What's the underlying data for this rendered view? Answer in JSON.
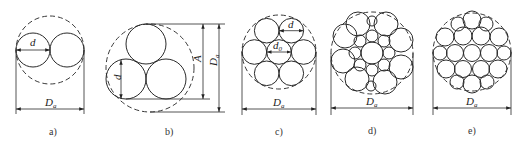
{
  "figure": {
    "panels": [
      {
        "id": "a",
        "caption": "a)",
        "strands": 2,
        "labels": {
          "d": "d",
          "D": "D",
          "D_sub": "a"
        }
      },
      {
        "id": "b",
        "caption": "b)",
        "strands": 3,
        "labels": {
          "d": "d",
          "A": "A",
          "D": "D",
          "D_sub": "a"
        }
      },
      {
        "id": "c",
        "caption": "c)",
        "strands": 7,
        "labels": {
          "d": "d",
          "d0": "d",
          "d0_sub": "0",
          "D": "D",
          "D_sub": "a"
        }
      },
      {
        "id": "d",
        "caption": "d)",
        "strands": 19,
        "labels": {
          "D": "D",
          "D_sub": "a"
        }
      },
      {
        "id": "e",
        "caption": "e)",
        "strands": 19,
        "labels": {
          "D": "D",
          "D_sub": "a"
        }
      }
    ]
  }
}
